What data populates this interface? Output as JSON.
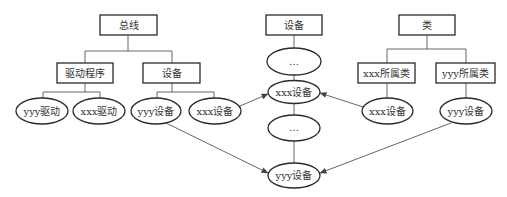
{
  "diagram": {
    "bus_tree": {
      "root": "总线",
      "drivers": "驱动程序",
      "devices": "设备",
      "driver_yyy": "yyy驱动",
      "driver_xxx": "xxx驱动",
      "device_yyy": "yyy设备",
      "device_xxx": "xxx设备"
    },
    "device_chain": {
      "root": "设备",
      "ellipsis_top": "…",
      "device_xxx": "xxx设备",
      "ellipsis_mid": "…",
      "device_yyy": "yyy设备"
    },
    "class_tree": {
      "root": "类",
      "class_xxx": "xxx所属类",
      "class_yyy": "yyy所属类",
      "device_xxx": "xxx设备",
      "device_yyy": "yyy设备"
    }
  }
}
